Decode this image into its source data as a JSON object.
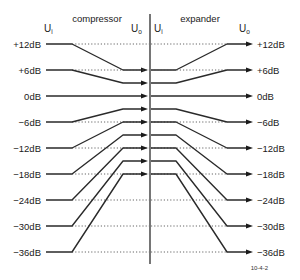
{
  "diagram": {
    "left_title": "compressor",
    "right_title": "expander",
    "input_symbol": "U",
    "input_subscript": "i",
    "output_symbol": "U",
    "output_subscript": "o",
    "figure_id": "10-4-2",
    "levels_db": [
      12,
      6,
      0,
      -6,
      -12,
      -18,
      -24,
      -30,
      -36
    ],
    "level_labels": [
      "+12dB",
      "+6dB",
      "0dB",
      "−6dB",
      "−12dB",
      "−18dB",
      "−24dB",
      "−30dB",
      "−36dB"
    ],
    "compression_ratio": 2,
    "colors": {
      "line": "#2a2a2a",
      "dotted": "#555555",
      "text": "#1a1a1a"
    }
  }
}
